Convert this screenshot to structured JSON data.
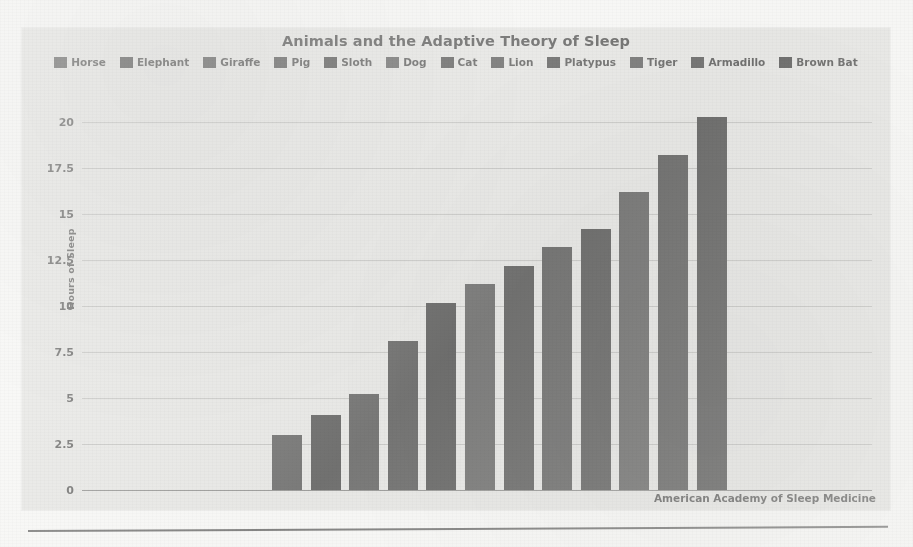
{
  "chart_data": {
    "type": "bar",
    "title": "Animals and the Adaptive Theory of Sleep",
    "xlabel": "",
    "ylabel": "Hours of Sleep",
    "ylim": [
      0,
      21
    ],
    "yticks": [
      "0",
      "2.5",
      "5",
      "7.5",
      "10",
      "12.5",
      "15",
      "17.5",
      "20"
    ],
    "ytick_values": [
      0,
      2.5,
      5,
      7.5,
      10,
      12.5,
      15,
      17.5,
      20
    ],
    "grid": true,
    "legend_position": "top",
    "categories": [
      "Horse",
      "Elephant",
      "Giraffe",
      "Pig",
      "Sloth",
      "Dog",
      "Cat",
      "Lion",
      "Platypus",
      "Tiger",
      "Armadillo",
      "Brown Bat"
    ],
    "values": [
      3.0,
      4.1,
      5.2,
      8.1,
      10.2,
      11.2,
      12.2,
      13.2,
      14.2,
      16.2,
      18.2,
      20.3
    ],
    "bar_colors": [
      "#3d3d3d",
      "#2f2f2f",
      "#3a3a3a",
      "#343434",
      "#2b2b2b",
      "#424242",
      "#303030",
      "#383838",
      "#2e2e2e",
      "#3f3f3f",
      "#333333",
      "#2c2c2c"
    ],
    "annotations": [
      "American Academy of Sleep Medicine"
    ]
  },
  "panel": {
    "title": "Animals and the Adaptive Theory of Sleep",
    "source_note": "American Academy of Sleep Medicine",
    "background_color": "#e4e4e2",
    "grid_color": "#7a7a7a",
    "text_color": "#2c2c2c"
  }
}
